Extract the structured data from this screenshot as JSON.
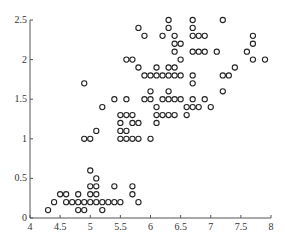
{
  "chart_data": {
    "type": "scatter",
    "title": "",
    "xlabel": "",
    "ylabel": "",
    "xlim": [
      4,
      8
    ],
    "ylim": [
      0,
      2.5
    ],
    "xticks": [
      "4",
      "4.5",
      "5",
      "5.5",
      "6",
      "6.5",
      "7",
      "7.5",
      "8"
    ],
    "yticks": [
      "0",
      "0.5",
      "1",
      "1.5",
      "2",
      "2.5"
    ],
    "grid": false,
    "legend": null,
    "marker": "open-circle",
    "series": [
      {
        "name": "points",
        "points": [
          [
            4.3,
            0.1
          ],
          [
            4.4,
            0.2
          ],
          [
            4.5,
            0.3
          ],
          [
            4.6,
            0.2
          ],
          [
            4.6,
            0.3
          ],
          [
            4.7,
            0.2
          ],
          [
            4.8,
            0.1
          ],
          [
            4.8,
            0.2
          ],
          [
            4.8,
            0.3
          ],
          [
            4.9,
            0.1
          ],
          [
            4.9,
            0.2
          ],
          [
            5.0,
            0.2
          ],
          [
            5.0,
            0.3
          ],
          [
            5.0,
            0.4
          ],
          [
            5.0,
            0.6
          ],
          [
            5.1,
            0.2
          ],
          [
            5.1,
            0.3
          ],
          [
            5.1,
            0.4
          ],
          [
            5.1,
            0.5
          ],
          [
            5.2,
            0.1
          ],
          [
            5.2,
            0.2
          ],
          [
            5.3,
            0.2
          ],
          [
            5.4,
            0.2
          ],
          [
            5.4,
            0.4
          ],
          [
            5.5,
            0.2
          ],
          [
            5.7,
            0.3
          ],
          [
            5.7,
            0.4
          ],
          [
            5.8,
            0.2
          ],
          [
            4.9,
            1.0
          ],
          [
            4.9,
            1.7
          ],
          [
            5.0,
            1.0
          ],
          [
            5.1,
            1.1
          ],
          [
            5.2,
            1.4
          ],
          [
            5.4,
            1.5
          ],
          [
            5.5,
            1.0
          ],
          [
            5.5,
            1.1
          ],
          [
            5.5,
            1.2
          ],
          [
            5.5,
            1.3
          ],
          [
            5.6,
            1.0
          ],
          [
            5.6,
            1.1
          ],
          [
            5.6,
            1.3
          ],
          [
            5.6,
            1.5
          ],
          [
            5.6,
            2.0
          ],
          [
            5.7,
            1.0
          ],
          [
            5.7,
            1.2
          ],
          [
            5.7,
            1.3
          ],
          [
            5.7,
            2.0
          ],
          [
            5.8,
            1.0
          ],
          [
            5.8,
            1.2
          ],
          [
            5.8,
            1.9
          ],
          [
            5.8,
            2.4
          ],
          [
            5.9,
            1.5
          ],
          [
            5.9,
            1.8
          ],
          [
            5.9,
            2.3
          ],
          [
            6.0,
            1.0
          ],
          [
            6.0,
            1.5
          ],
          [
            6.0,
            1.6
          ],
          [
            6.0,
            1.8
          ],
          [
            6.1,
            1.2
          ],
          [
            6.1,
            1.3
          ],
          [
            6.1,
            1.4
          ],
          [
            6.1,
            1.8
          ],
          [
            6.1,
            1.9
          ],
          [
            6.2,
            1.3
          ],
          [
            6.2,
            1.5
          ],
          [
            6.2,
            1.8
          ],
          [
            6.2,
            2.3
          ],
          [
            6.3,
            1.3
          ],
          [
            6.3,
            1.5
          ],
          [
            6.3,
            1.6
          ],
          [
            6.3,
            1.8
          ],
          [
            6.3,
            1.9
          ],
          [
            6.3,
            2.4
          ],
          [
            6.3,
            2.5
          ],
          [
            6.4,
            1.3
          ],
          [
            6.4,
            1.5
          ],
          [
            6.4,
            1.8
          ],
          [
            6.4,
            1.9
          ],
          [
            6.4,
            2.1
          ],
          [
            6.4,
            2.2
          ],
          [
            6.4,
            2.3
          ],
          [
            6.5,
            1.5
          ],
          [
            6.5,
            1.8
          ],
          [
            6.5,
            2.0
          ],
          [
            6.5,
            2.2
          ],
          [
            6.6,
            1.3
          ],
          [
            6.6,
            1.4
          ],
          [
            6.7,
            1.4
          ],
          [
            6.7,
            1.5
          ],
          [
            6.7,
            1.7
          ],
          [
            6.7,
            1.8
          ],
          [
            6.7,
            2.1
          ],
          [
            6.7,
            2.3
          ],
          [
            6.7,
            2.4
          ],
          [
            6.7,
            2.5
          ],
          [
            6.8,
            1.4
          ],
          [
            6.8,
            2.1
          ],
          [
            6.8,
            2.3
          ],
          [
            6.9,
            1.5
          ],
          [
            6.9,
            2.1
          ],
          [
            6.9,
            2.3
          ],
          [
            7.0,
            1.4
          ],
          [
            7.1,
            2.1
          ],
          [
            7.2,
            1.6
          ],
          [
            7.2,
            1.8
          ],
          [
            7.2,
            2.5
          ],
          [
            7.3,
            1.8
          ],
          [
            7.4,
            1.9
          ],
          [
            7.6,
            2.1
          ],
          [
            7.7,
            2.0
          ],
          [
            7.7,
            2.2
          ],
          [
            7.7,
            2.3
          ],
          [
            7.9,
            2.0
          ]
        ]
      }
    ]
  }
}
